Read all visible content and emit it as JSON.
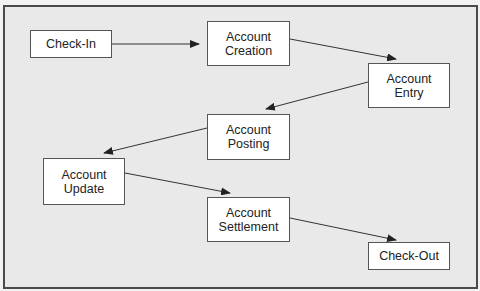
{
  "diagram": {
    "type": "flowchart",
    "nodes": [
      {
        "id": "check-in",
        "label": "Check-In"
      },
      {
        "id": "account-creation",
        "label": "Account\nCreation"
      },
      {
        "id": "account-entry",
        "label": "Account\nEntry"
      },
      {
        "id": "account-posting",
        "label": "Account\nPosting"
      },
      {
        "id": "account-update",
        "label": "Account\nUpdate"
      },
      {
        "id": "account-settlement",
        "label": "Account\nSettlement"
      },
      {
        "id": "check-out",
        "label": "Check-Out"
      }
    ],
    "edges": [
      {
        "from": "check-in",
        "to": "account-creation"
      },
      {
        "from": "account-creation",
        "to": "account-entry"
      },
      {
        "from": "account-entry",
        "to": "account-posting"
      },
      {
        "from": "account-posting",
        "to": "account-update"
      },
      {
        "from": "account-update",
        "to": "account-settlement"
      },
      {
        "from": "account-settlement",
        "to": "check-out"
      }
    ],
    "colors": {
      "background": "#e9e9e9",
      "border": "#4a4a4a",
      "node_fill": "#ffffff",
      "arrow": "#333333"
    }
  }
}
